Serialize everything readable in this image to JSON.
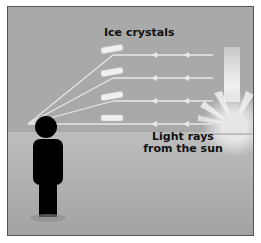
{
  "labels": {
    "ice_crystals": "Ice crystals",
    "light_rays_line1": "Light rays",
    "light_rays_line2": "from the sun"
  },
  "colors": {
    "sky": "#a9a9a9",
    "ground": "#b4b4b4",
    "ray": "#e8e8e8",
    "crystal": "#f0f0f0",
    "person": "#000000",
    "sun": "#f5f5f5"
  }
}
